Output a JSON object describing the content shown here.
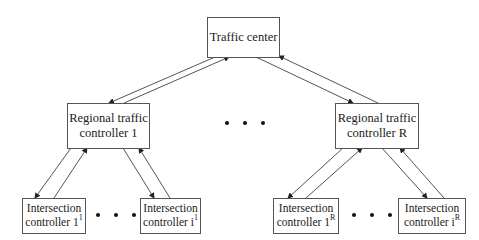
{
  "diagram": {
    "traffic_center": {
      "label": "Traffic center"
    },
    "regional_controllers": [
      {
        "line1": "Regional traffic",
        "line2": "controller 1"
      },
      {
        "line1": "Regional traffic",
        "line2": "controller R"
      }
    ],
    "intersection_controllers": [
      {
        "line1": "Intersection",
        "line2_base": "controller 1",
        "sup": "1"
      },
      {
        "line1": "Intersection",
        "line2_base": "controller i",
        "sup": "1"
      },
      {
        "line1": "Intersection",
        "line2_base": "controller 1",
        "sup": "R"
      },
      {
        "line1": "Intersection",
        "line2_base": "controller i",
        "sup": "R"
      }
    ],
    "ellipsis_symbol": "• • •",
    "colors": {
      "line": "#555555",
      "text": "#1a1a1a",
      "background": "#ffffff"
    }
  }
}
